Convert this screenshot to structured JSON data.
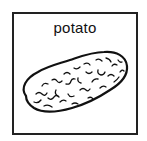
{
  "card": {
    "label": "potato",
    "icon": "potato-icon",
    "border_color": "#222222",
    "background_color": "#ffffff"
  }
}
